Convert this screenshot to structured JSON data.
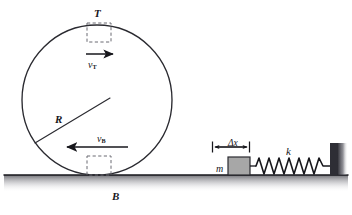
{
  "figure": {
    "background_color": "#ffffff",
    "ink_color": "#17171c",
    "ground": {
      "name": "ground-line",
      "y": 175,
      "x_start": 4,
      "x_end": 348,
      "shadow_color": "#8d8d92"
    },
    "wheel": {
      "name": "rolling-wheel",
      "center_x": 97,
      "center_y": 100,
      "radius": 75,
      "stroke_color": "#2a2a30",
      "contact_point_label": "B",
      "top_point_label": "T",
      "radius_label": "R",
      "radius_line": {
        "from_x": 35,
        "from_y": 143,
        "to_x": 110,
        "to_y": 98
      },
      "top_box": {
        "name": "top-dashed-box",
        "x": 87,
        "y": 23,
        "width": 24,
        "height": 19,
        "style": "dashed"
      },
      "bottom_box": {
        "name": "bottom-dashed-box",
        "x": 87,
        "y": 156,
        "width": 24,
        "height": 19,
        "style": "dashed"
      },
      "top_velocity": {
        "name": "top-velocity-arrow",
        "label": "v",
        "subscript": "T",
        "direction": "right",
        "x_start": 86,
        "x_end": 114,
        "y": 54
      },
      "bottom_velocity": {
        "name": "bottom-velocity-arrow",
        "label": "v",
        "subscript": "B",
        "direction": "left",
        "x_start": 66,
        "x_end": 128,
        "y": 147
      }
    },
    "spring_system": {
      "name": "spring-mass-system",
      "mass_label": "m",
      "spring_constant_label": "k",
      "displacement_label": "Δx",
      "mass_block": {
        "name": "mass-block",
        "x": 228,
        "y": 157,
        "width": 22,
        "height": 18,
        "fill_color": "#a7a7a7",
        "stroke_color": "#2a2a30"
      },
      "dimension_line": {
        "name": "delta-x-dimension-line",
        "x_start": 212,
        "x_end": 250,
        "y": 147
      },
      "spring": {
        "name": "spring-coil",
        "x_start": 252,
        "x_end": 330,
        "y": 166,
        "coils": 12,
        "amplitude": 8,
        "stroke_color": "#17171c"
      },
      "wall": {
        "name": "right-wall",
        "x": 330,
        "y_top": 143,
        "y_bottom": 175,
        "width": 7,
        "fill_color": "#3a3a40"
      }
    }
  }
}
